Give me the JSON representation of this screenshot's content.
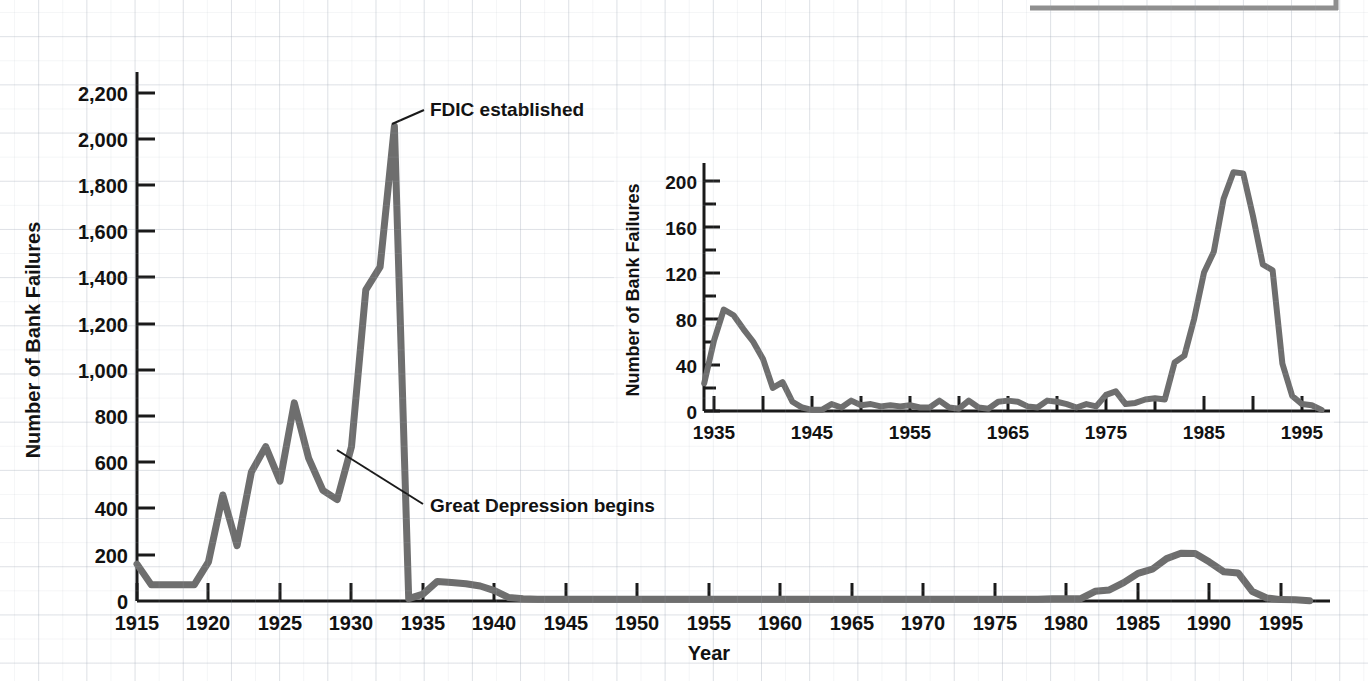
{
  "chart_data": [
    {
      "id": "main",
      "type": "line",
      "title": "",
      "xlabel": "Year",
      "ylabel": "Number of Bank Failures",
      "xlim": [
        1915,
        1998
      ],
      "ylim": [
        0,
        2300
      ],
      "xticks": [
        1915,
        1920,
        1925,
        1930,
        1935,
        1940,
        1945,
        1950,
        1955,
        1960,
        1965,
        1970,
        1975,
        1980,
        1985,
        1990,
        1995
      ],
      "xtick_labels": [
        "1915",
        "1920",
        "1925",
        "1930",
        "1935",
        "1940",
        "1945",
        "1950",
        "1955",
        "1960",
        "1965",
        "1970",
        "1975",
        "1980",
        "1985",
        "1990",
        "1995"
      ],
      "yticks": [
        0,
        200,
        400,
        600,
        800,
        1000,
        1200,
        1400,
        1600,
        1800,
        2000,
        2200
      ],
      "ytick_labels": [
        "0",
        "200",
        "400",
        "600",
        "800",
        "1,000",
        "1,200",
        "1,400",
        "1,600",
        "1,800",
        "2,000",
        "2,200"
      ],
      "grid": false,
      "legend": "none",
      "line_color": "#6e6e6e",
      "series": [
        {
          "name": "Number of Bank Failures",
          "x": [
            1915,
            1916,
            1917,
            1918,
            1919,
            1920,
            1921,
            1922,
            1923,
            1924,
            1925,
            1926,
            1927,
            1928,
            1929,
            1930,
            1931,
            1932,
            1933,
            1934,
            1935,
            1936,
            1937,
            1938,
            1939,
            1940,
            1941,
            1942,
            1943,
            1944,
            1945,
            1946,
            1947,
            1948,
            1949,
            1950,
            1951,
            1952,
            1953,
            1954,
            1955,
            1956,
            1957,
            1958,
            1959,
            1960,
            1961,
            1962,
            1963,
            1964,
            1965,
            1966,
            1967,
            1968,
            1969,
            1970,
            1971,
            1972,
            1973,
            1974,
            1975,
            1976,
            1977,
            1978,
            1979,
            1980,
            1981,
            1982,
            1983,
            1984,
            1985,
            1986,
            1987,
            1988,
            1989,
            1990,
            1991,
            1992,
            1993,
            1994,
            1995,
            1996,
            1997
          ],
          "values": [
            160,
            70,
            70,
            70,
            70,
            170,
            460,
            240,
            560,
            670,
            520,
            860,
            620,
            480,
            440,
            670,
            1350,
            1450,
            2060,
            10,
            30,
            85,
            80,
            75,
            65,
            45,
            15,
            10,
            8,
            8,
            8,
            8,
            8,
            8,
            8,
            8,
            8,
            8,
            8,
            8,
            8,
            8,
            8,
            8,
            8,
            8,
            8,
            8,
            8,
            8,
            8,
            8,
            8,
            8,
            8,
            8,
            8,
            8,
            8,
            8,
            8,
            8,
            8,
            8,
            10,
            10,
            10,
            42,
            48,
            80,
            120,
            138,
            184,
            207,
            206,
            169,
            127,
            122,
            41,
            13,
            6,
            5,
            1
          ]
        }
      ],
      "annotations": [
        {
          "label": "FDIC established",
          "label_x": 1934.0,
          "label_y": 2300,
          "point_x": 1933,
          "point_y": 2060
        },
        {
          "label": "Great Depression begins",
          "label_x": 1939.2,
          "label_y": 400,
          "point_x": 1929.2,
          "point_y": 640
        }
      ]
    },
    {
      "id": "inset",
      "type": "line",
      "title": "",
      "xlabel": "",
      "ylabel": "Number of Bank Failures",
      "xlim": [
        1934,
        1998
      ],
      "ylim": [
        0,
        215
      ],
      "xticks": [
        1935,
        1940,
        1945,
        1950,
        1955,
        1960,
        1965,
        1970,
        1975,
        1980,
        1985,
        1990,
        1995
      ],
      "xtick_labels": [
        "1935",
        "",
        "1945",
        "",
        "1955",
        "",
        "1965",
        "",
        "1975",
        "",
        "1985",
        "",
        "1995"
      ],
      "yticks": [
        0,
        40,
        80,
        120,
        160,
        200
      ],
      "ytick_labels": [
        "0",
        "40",
        "80",
        "120",
        "160",
        "200"
      ],
      "yticks_minor": [
        20,
        60,
        100,
        140,
        180
      ],
      "grid": false,
      "legend": "none",
      "line_color": "#6e6e6e",
      "series": [
        {
          "name": "Number of Bank Failures",
          "x": [
            1934,
            1935,
            1936,
            1937,
            1938,
            1939,
            1940,
            1941,
            1942,
            1943,
            1944,
            1945,
            1946,
            1947,
            1948,
            1949,
            1950,
            1951,
            1952,
            1953,
            1954,
            1955,
            1956,
            1957,
            1958,
            1959,
            1960,
            1961,
            1962,
            1963,
            1964,
            1965,
            1966,
            1967,
            1968,
            1969,
            1970,
            1971,
            1972,
            1973,
            1974,
            1975,
            1976,
            1977,
            1978,
            1979,
            1980,
            1981,
            1982,
            1983,
            1984,
            1985,
            1986,
            1987,
            1988,
            1989,
            1990,
            1991,
            1992,
            1993,
            1994,
            1995,
            1996,
            1997
          ],
          "values": [
            24,
            61,
            88,
            83,
            71,
            60,
            45,
            20,
            25,
            8,
            3,
            1,
            1,
            6,
            3,
            9,
            5,
            6,
            4,
            5,
            4,
            5,
            3,
            3,
            9,
            3,
            2,
            9,
            3,
            2,
            8,
            9,
            8,
            4,
            3,
            9,
            8,
            6,
            3,
            6,
            4,
            14,
            17,
            6,
            7,
            10,
            11,
            10,
            42,
            48,
            80,
            120,
            138,
            184,
            207,
            206,
            169,
            127,
            122,
            41,
            13,
            6,
            5,
            1
          ]
        }
      ],
      "annotations": []
    }
  ],
  "main_chart": {
    "y_axis_title": "Number of Bank Failures",
    "x_axis_title": "Year",
    "ytick_labels": [
      "2,200",
      "2,000",
      "1,800",
      "1,600",
      "1,400",
      "1,200",
      "1,000",
      "800",
      "600",
      "400",
      "200",
      "0"
    ],
    "xtick_labels": [
      "1915",
      "1920",
      "1925",
      "1930",
      "1935",
      "1940",
      "1945",
      "1950",
      "1955",
      "1960",
      "1965",
      "1970",
      "1975",
      "1980",
      "1985",
      "1990",
      "1995"
    ],
    "annotation_fdic": "FDIC established",
    "annotation_depression": "Great Depression begins"
  },
  "inset_chart": {
    "y_axis_title": "Number of Bank Failures",
    "ytick_labels": [
      "200",
      "160",
      "120",
      "80",
      "40",
      "0"
    ],
    "xtick_labels": [
      "1935",
      "1945",
      "1955",
      "1965",
      "1975",
      "1985",
      "1995"
    ]
  },
  "colors": {
    "line": "#6e6e6e",
    "axis": "#1a1a1a",
    "text": "#111111",
    "grid": "#aab2be",
    "background": "#ffffff"
  }
}
